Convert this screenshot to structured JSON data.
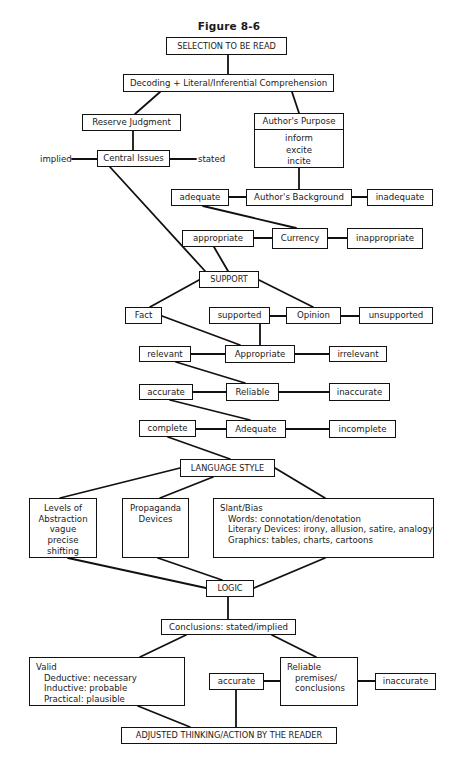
{
  "figure": {
    "title": "Figure 8-6"
  },
  "nodes": {
    "selection": "SELECTION TO BE READ",
    "decoding": "Decoding + Literal/Inferential Comprehension",
    "reserve_judgment": "Reserve Judgment",
    "authors_purpose": {
      "header": "Author's Purpose",
      "items": [
        "inform",
        "excite",
        "incite"
      ]
    },
    "central_issues": "Central Issues",
    "central_issues_left": "implied",
    "central_issues_right": "stated",
    "authors_background": "Author's Background",
    "background_left": "adequate",
    "background_right": "inadequate",
    "currency": "Currency",
    "currency_left": "appropriate",
    "currency_right": "inappropriate",
    "support": "SUPPORT",
    "fact": "Fact",
    "opinion": "Opinion",
    "opinion_left": "supported",
    "opinion_right": "unsupported",
    "appropriate": "Appropriate",
    "appropriate_left": "relevant",
    "appropriate_right": "irrelevant",
    "reliable": "Reliable",
    "reliable_left": "accurate",
    "reliable_right": "inaccurate",
    "adequate": "Adequate",
    "adequate_left": "complete",
    "adequate_right": "incomplete",
    "language_style": "LANGUAGE STYLE",
    "levels_of_abstraction": {
      "lines": [
        "Levels of",
        "Abstraction",
        "vague",
        "precise",
        "shifting"
      ]
    },
    "propaganda": {
      "lines": [
        "Propaganda",
        "Devices"
      ]
    },
    "slant_bias": {
      "heading": "Slant/Bias",
      "lines": [
        "Words:  connotation/denotation",
        "Literary Devices:  irony, allusion, satire, analogy",
        "Graphics:  tables, charts, cartoons"
      ]
    },
    "logic": "LOGIC",
    "conclusions": "Conclusions:  stated/implied",
    "valid": {
      "heading": "Valid",
      "lines": [
        "Deductive:  necessary",
        "Inductive:  probable",
        "Practical:  plausible"
      ]
    },
    "reliable_premises": {
      "lines": [
        "Reliable",
        "premises/",
        "conclusions"
      ]
    },
    "premises_left": "accurate",
    "premises_right": "inaccurate",
    "adjusted": "ADJUSTED THINKING/ACTION BY THE READER"
  },
  "colors": {
    "line": "#111111",
    "background": "#ffffff",
    "text": "#1a1a1a"
  }
}
